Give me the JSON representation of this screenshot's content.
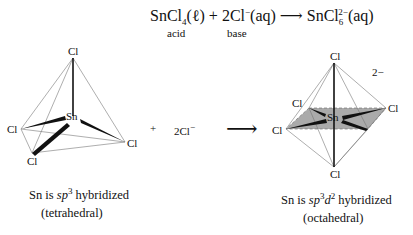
{
  "equation": {
    "reactant1": "SnCl",
    "reactant1_sub": "4",
    "reactant1_state": "(ℓ)",
    "plus": "+",
    "reactant2": "2Cl",
    "reactant2_sup": "−",
    "reactant2_state": "(aq)",
    "arrow": "⟶",
    "product": "SnCl",
    "product_sub": "6",
    "product_sup": "2−",
    "product_state": "(aq)",
    "label_acid": "acid",
    "label_base": "base"
  },
  "tetrahedral": {
    "center": "Sn",
    "ligands": [
      "Cl",
      "Cl",
      "Cl",
      "Cl"
    ],
    "caption_line1_prefix": "Sn is ",
    "caption_sp": "sp",
    "caption_sup": "3",
    "caption_line1_suffix": " hybridized",
    "caption_line2": "(tetrahedral)"
  },
  "middle": {
    "plus": "+",
    "reagent": "2Cl",
    "reagent_sup": "−",
    "arrow": "⟶"
  },
  "octahedral": {
    "center": "Sn",
    "ligands": [
      "Cl",
      "Cl",
      "Cl",
      "Cl",
      "Cl",
      "Cl"
    ],
    "charge": "2−",
    "caption_line1_prefix": "Sn is ",
    "caption_sp": "sp",
    "caption_sup1": "3",
    "caption_d": "d",
    "caption_sup2": "2",
    "caption_line1_suffix": " hybridized",
    "caption_line2": "(octahedral)"
  }
}
